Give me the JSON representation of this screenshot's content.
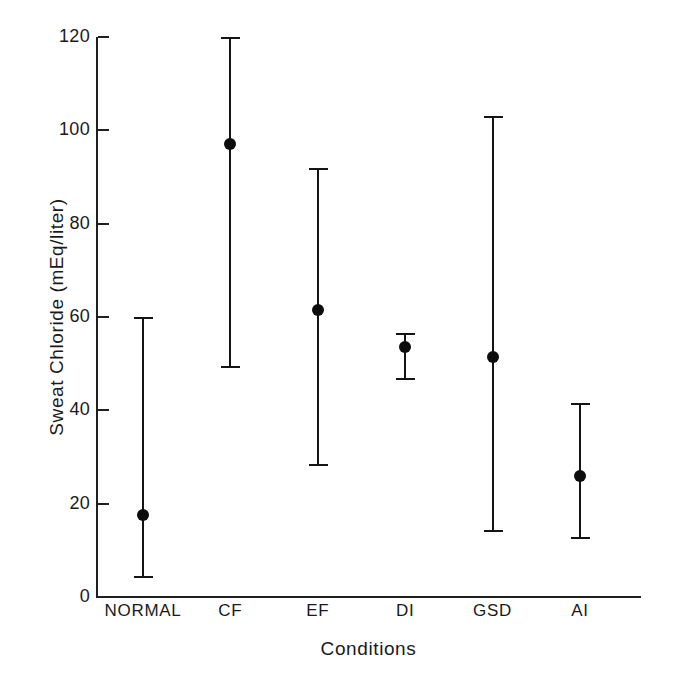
{
  "chart_data": {
    "type": "scatter",
    "title": "",
    "xlabel": "Conditions",
    "ylabel": "Sweat Chloride (mEq/liter)",
    "categories": [
      "NORMAL",
      "CF",
      "EF",
      "DI",
      "GSD",
      "AI"
    ],
    "ylim": [
      0,
      120
    ],
    "yticks": [
      0,
      20,
      40,
      60,
      80,
      100,
      120
    ],
    "ytick_labels": [
      "0",
      "20",
      "40",
      "60",
      "80",
      "100",
      "120"
    ],
    "grid": false,
    "legend": "none",
    "marker": "filled-circle",
    "error_bar_style": "capped-vertical-range",
    "values": [
      17.5,
      97,
      61.5,
      53.5,
      51.5,
      26
    ],
    "range_low": [
      4,
      49,
      28,
      46.5,
      14,
      12.5
    ],
    "range_high": [
      60,
      120,
      92,
      56.5,
      103,
      41.5
    ],
    "points": [
      {
        "category": "NORMAL",
        "mean": 17.5,
        "low": 4,
        "high": 60
      },
      {
        "category": "CF",
        "mean": 97,
        "low": 49,
        "high": 120
      },
      {
        "category": "EF",
        "mean": 61.5,
        "low": 28,
        "high": 92
      },
      {
        "category": "DI",
        "mean": 53.5,
        "low": 46.5,
        "high": 56.5
      },
      {
        "category": "GSD",
        "mean": 51.5,
        "low": 14,
        "high": 103
      },
      {
        "category": "AI",
        "mean": 26,
        "low": 12.5,
        "high": 41.5
      }
    ],
    "colors": {
      "background": "#ffffff",
      "axis": "#1f1f1f",
      "marker": "#0d0d0d",
      "error_bar": "#141414",
      "text": "#1a1a1a"
    }
  }
}
